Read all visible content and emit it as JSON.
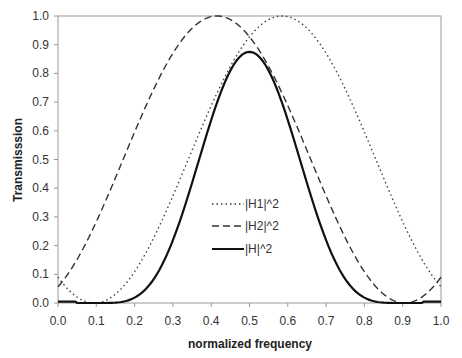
{
  "chart_data": {
    "type": "line",
    "title": "",
    "xlabel": "normalized frequency",
    "ylabel": "Transmisssion",
    "xlim": [
      0.0,
      1.0
    ],
    "ylim": [
      0.0,
      1.0
    ],
    "x_ticks": [
      "0.0",
      "0.1",
      "0.2",
      "0.3",
      "0.4",
      "0.5",
      "0.6",
      "0.7",
      "0.8",
      "0.9",
      "1.0"
    ],
    "y_ticks": [
      "0.0",
      "0.1",
      "0.2",
      "0.3",
      "0.4",
      "0.5",
      "0.6",
      "0.7",
      "0.8",
      "0.9",
      "1.0"
    ],
    "grid": false,
    "legend_position": "inside-center",
    "x": [
      0.0,
      0.1,
      0.2,
      0.3,
      0.4,
      0.5,
      0.6,
      0.7,
      0.8,
      0.9,
      1.0
    ],
    "series": [
      {
        "name": "|H1|^2",
        "style": "dotted",
        "values": [
          0.07,
          0.0,
          0.12,
          0.43,
          0.78,
          0.97,
          1.0,
          0.87,
          0.58,
          0.28,
          0.08
        ]
      },
      {
        "name": "|H2|^2",
        "style": "dashed",
        "values": [
          0.07,
          0.28,
          0.58,
          0.87,
          1.0,
          0.97,
          0.78,
          0.43,
          0.12,
          0.0,
          0.06
        ]
      },
      {
        "name": "|H|^2",
        "style": "solid",
        "values": [
          0.005,
          0.0,
          0.07,
          0.37,
          0.78,
          0.875,
          0.78,
          0.37,
          0.07,
          0.0,
          0.005
        ]
      }
    ]
  },
  "legend": {
    "h1": "|H1|^2",
    "h2": "|H2|^2",
    "h": "|H|^2"
  }
}
